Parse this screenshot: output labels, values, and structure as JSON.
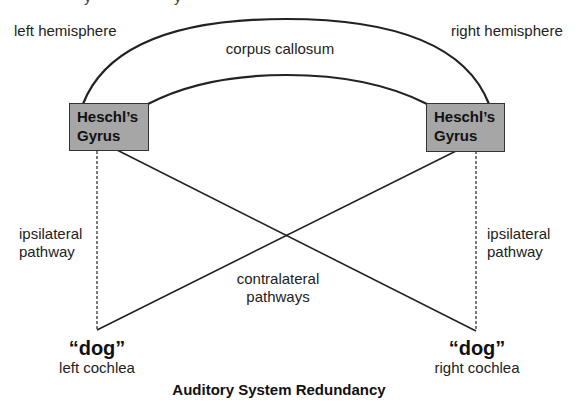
{
  "title": "Auditory System Redundancy",
  "hemispheres": {
    "left": "left hemisphere",
    "right": "right hemisphere"
  },
  "corpus_callosum": "corpus callosum",
  "nodes": {
    "left_gyrus": {
      "line1": "Heschl’s",
      "line2": "Gyrus"
    },
    "right_gyrus": {
      "line1": "Heschl’s",
      "line2": "Gyrus"
    }
  },
  "pathways": {
    "left_ipsilateral": {
      "line1": "ipsilateral",
      "line2": "pathway"
    },
    "right_ipsilateral": {
      "line1": "ipsilateral",
      "line2": "pathway"
    },
    "contralateral": {
      "line1": "contralateral",
      "line2": "pathways"
    }
  },
  "inputs": {
    "left": {
      "word": "“dog”",
      "label": "left cochlea"
    },
    "right": {
      "word": "“dog”",
      "label": "right cochlea"
    }
  },
  "colors": {
    "box_fill": "#a6a6a6",
    "line": "#222222"
  }
}
